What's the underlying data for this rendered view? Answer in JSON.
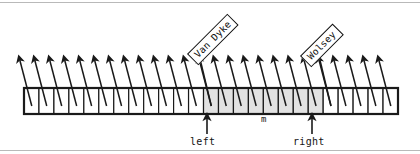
{
  "figure": {
    "type": "array-diagram",
    "background_color": "#ffffff",
    "border_color": "#b9b9b9"
  },
  "array": {
    "x": 24,
    "y": 88,
    "width": 374,
    "height": 26,
    "cell_count": 25,
    "cell_width": 14.96,
    "border_color": "#1a1a1a",
    "cell_fill_default": "#ffffff",
    "cell_fill_highlight": "#e2e2e2",
    "highlight_start_index": 12,
    "highlight_end_index": 19,
    "cells": [
      {
        "index": 0,
        "highlighted": false
      },
      {
        "index": 1,
        "highlighted": false
      },
      {
        "index": 2,
        "highlighted": false
      },
      {
        "index": 3,
        "highlighted": false
      },
      {
        "index": 4,
        "highlighted": false
      },
      {
        "index": 5,
        "highlighted": false
      },
      {
        "index": 6,
        "highlighted": false
      },
      {
        "index": 7,
        "highlighted": false
      },
      {
        "index": 8,
        "highlighted": false
      },
      {
        "index": 9,
        "highlighted": false
      },
      {
        "index": 10,
        "highlighted": false
      },
      {
        "index": 11,
        "highlighted": false
      },
      {
        "index": 12,
        "highlighted": true
      },
      {
        "index": 13,
        "highlighted": true
      },
      {
        "index": 14,
        "highlighted": true
      },
      {
        "index": 15,
        "highlighted": true
      },
      {
        "index": 16,
        "highlighted": true
      },
      {
        "index": 17,
        "highlighted": true
      },
      {
        "index": 18,
        "highlighted": true
      },
      {
        "index": 19,
        "highlighted": true
      },
      {
        "index": 20,
        "highlighted": false
      },
      {
        "index": 21,
        "highlighted": false
      },
      {
        "index": 22,
        "highlighted": false
      },
      {
        "index": 23,
        "highlighted": false
      },
      {
        "index": 24,
        "highlighted": false
      }
    ]
  },
  "pointers": {
    "color": "#1a1a1a",
    "arrow_tip_y": 60,
    "arrow_tail_y": 98,
    "dx": -12,
    "count": 25
  },
  "callouts": [
    {
      "name": "van-dyke",
      "text": "Van Dyke",
      "cell_index": 12,
      "box_left": 187,
      "box_top": 54,
      "rotation_deg": -45,
      "fill": "#ffffff",
      "stroke": "#111111"
    },
    {
      "name": "wolsey",
      "text": "Wolsey",
      "cell_index": 20,
      "box_left": 300,
      "box_top": 56,
      "rotation_deg": -45,
      "fill": "#ffffff",
      "stroke": "#111111"
    }
  ],
  "markers": [
    {
      "name": "left",
      "label": "left",
      "x": 207,
      "arrow_top": 118,
      "arrow_bottom": 134,
      "label_x": 190,
      "label_y": 136
    },
    {
      "name": "right",
      "label": "right",
      "x": 312,
      "arrow_top": 118,
      "arrow_bottom": 134,
      "label_x": 293,
      "label_y": 136
    }
  ],
  "mid_marker": {
    "name": "m",
    "label": "m",
    "x": 261,
    "y": 114
  }
}
